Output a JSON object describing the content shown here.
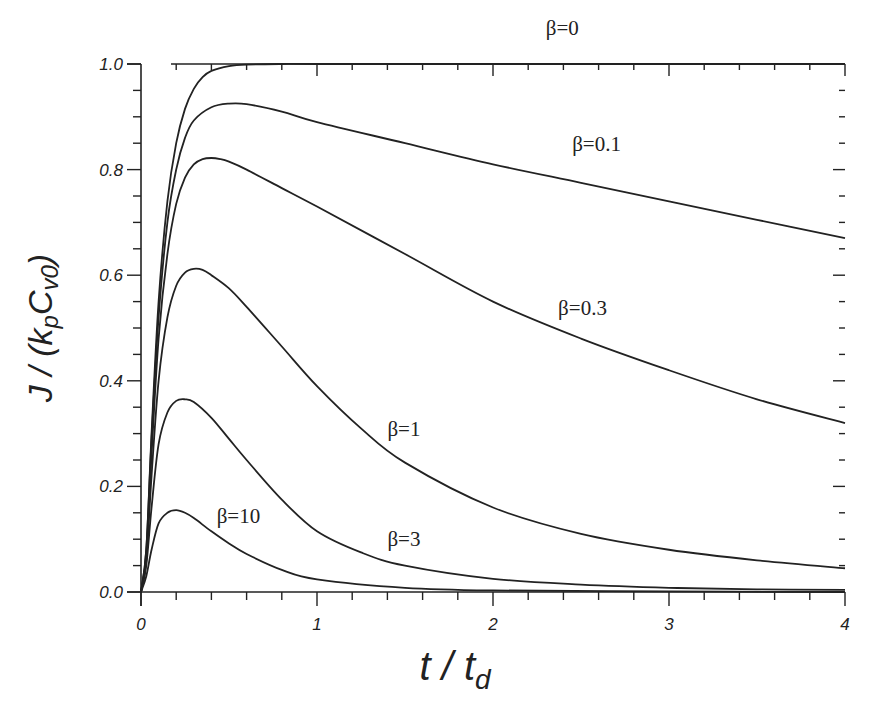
{
  "chart_data": {
    "type": "line",
    "title": "",
    "xlabel": {
      "main": "t / t",
      "sub": "d"
    },
    "ylabel": {
      "parts": [
        "J / (k",
        "p",
        "C",
        "v0",
        ")"
      ]
    },
    "xlim": [
      0,
      4
    ],
    "ylim": [
      0,
      1.0
    ],
    "x_ticks": [
      0,
      1,
      2,
      3,
      4
    ],
    "x_tick_labels": [
      "0",
      "1",
      "2",
      "3",
      "4"
    ],
    "y_ticks": [
      0.0,
      0.2,
      0.4,
      0.6,
      0.8,
      1.0
    ],
    "y_tick_labels": [
      "0.0",
      "0.2",
      "0.4",
      "0.6",
      "0.8",
      "1.0"
    ],
    "x_minor_step": 0.2,
    "y_minor_step": 0.05,
    "grid": false,
    "legend": "inline-labels",
    "series": [
      {
        "name": "β=0",
        "label": "β=0",
        "x": [
          0,
          0.03,
          0.06,
          0.1,
          0.15,
          0.2,
          0.25,
          0.3,
          0.35,
          0.4,
          0.5,
          0.6,
          0.8,
          1.0,
          2.0,
          3.0,
          4.0
        ],
        "y": [
          0,
          0.08,
          0.3,
          0.55,
          0.74,
          0.85,
          0.915,
          0.953,
          0.975,
          0.987,
          0.996,
          0.999,
          1.0,
          1.0,
          1.0,
          1.0,
          1.0
        ]
      },
      {
        "name": "β=0.1",
        "label": "β=0.1",
        "x": [
          0,
          0.03,
          0.06,
          0.1,
          0.15,
          0.2,
          0.25,
          0.3,
          0.4,
          0.5,
          0.6,
          0.8,
          1.0,
          1.5,
          2.0,
          2.5,
          3.0,
          3.5,
          4.0
        ],
        "y": [
          0,
          0.08,
          0.29,
          0.52,
          0.7,
          0.8,
          0.86,
          0.893,
          0.918,
          0.925,
          0.924,
          0.91,
          0.89,
          0.85,
          0.81,
          0.775,
          0.74,
          0.705,
          0.67
        ]
      },
      {
        "name": "β=0.3",
        "label": "β=0.3",
        "x": [
          0,
          0.03,
          0.06,
          0.1,
          0.15,
          0.2,
          0.25,
          0.3,
          0.35,
          0.4,
          0.45,
          0.5,
          0.6,
          0.8,
          1.0,
          1.5,
          2.0,
          2.5,
          3.0,
          3.5,
          4.0
        ],
        "y": [
          0,
          0.07,
          0.26,
          0.48,
          0.64,
          0.735,
          0.785,
          0.81,
          0.82,
          0.822,
          0.82,
          0.815,
          0.8,
          0.765,
          0.73,
          0.64,
          0.55,
          0.48,
          0.42,
          0.365,
          0.32
        ]
      },
      {
        "name": "β=1",
        "label": "β=1",
        "x": [
          0,
          0.03,
          0.06,
          0.1,
          0.15,
          0.2,
          0.25,
          0.3,
          0.35,
          0.4,
          0.5,
          0.6,
          0.8,
          1.0,
          1.25,
          1.5,
          2.0,
          2.5,
          3.0,
          3.5,
          4.0
        ],
        "y": [
          0,
          0.06,
          0.22,
          0.4,
          0.52,
          0.58,
          0.605,
          0.612,
          0.61,
          0.6,
          0.575,
          0.54,
          0.465,
          0.39,
          0.31,
          0.245,
          0.16,
          0.11,
          0.08,
          0.06,
          0.045
        ]
      },
      {
        "name": "β=3",
        "label": "β=3",
        "x": [
          0,
          0.03,
          0.06,
          0.1,
          0.15,
          0.2,
          0.25,
          0.3,
          0.4,
          0.5,
          0.6,
          0.8,
          1.0,
          1.25,
          1.5,
          2.0,
          2.5,
          3.0,
          3.5,
          4.0
        ],
        "y": [
          0,
          0.05,
          0.16,
          0.28,
          0.34,
          0.362,
          0.365,
          0.36,
          0.33,
          0.29,
          0.25,
          0.175,
          0.115,
          0.075,
          0.05,
          0.025,
          0.014,
          0.008,
          0.005,
          0.004
        ]
      },
      {
        "name": "β=10",
        "label": "β=10",
        "x": [
          0,
          0.03,
          0.06,
          0.1,
          0.15,
          0.2,
          0.25,
          0.3,
          0.4,
          0.5,
          0.6,
          0.8,
          1.0,
          1.5,
          2.0,
          3.0,
          4.0
        ],
        "y": [
          0,
          0.03,
          0.08,
          0.13,
          0.15,
          0.155,
          0.15,
          0.14,
          0.115,
          0.092,
          0.072,
          0.042,
          0.024,
          0.008,
          0.003,
          0.001,
          0.0
        ]
      }
    ],
    "annotations": [
      {
        "text": "β=0",
        "x": 2.3,
        "y": 1.055
      },
      {
        "text": "β=0.1",
        "x": 2.45,
        "y": 0.835
      },
      {
        "text": "β=0.3",
        "x": 2.37,
        "y": 0.525
      },
      {
        "text": "β=1",
        "x": 1.4,
        "y": 0.295
      },
      {
        "text": "β=3",
        "x": 1.4,
        "y": 0.088
      },
      {
        "text": "β=10",
        "x": 0.43,
        "y": 0.13
      }
    ]
  }
}
